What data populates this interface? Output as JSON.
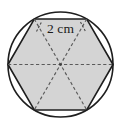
{
  "figure": {
    "measurement_label": "2 cm",
    "colors": {
      "background": "#ffffff",
      "hexagon_fill": "#d4d4d4",
      "outline": "#1e1e1e",
      "dashed_line": "#5a5a5a",
      "label_text": "#1a1a1a"
    },
    "circle": {
      "center_x": 60.5,
      "center_y": 64.5,
      "radius": 52.5,
      "stroke_width": 1.6
    },
    "hexagon": {
      "sides": 6,
      "orientation": "pointy-left-right",
      "circumradius": 52.5,
      "stroke_width": 1.6,
      "vertices": [
        {
          "x": 113.0,
          "y": 64.5
        },
        {
          "x": 86.75,
          "y": 19.03
        },
        {
          "x": 34.25,
          "y": 19.03
        },
        {
          "x": 8.0,
          "y": 64.5
        },
        {
          "x": 34.25,
          "y": 109.97
        },
        {
          "x": 86.75,
          "y": 109.97
        }
      ]
    },
    "diagonals": [
      {
        "name": "diagonal-horizontal",
        "from": 3,
        "to": 0
      },
      {
        "name": "diagonal-upper-left-to-lower-right",
        "from": 2,
        "to": 5
      },
      {
        "name": "diagonal-upper-right-to-lower-left",
        "from": 1,
        "to": 4
      }
    ],
    "tick_marks": {
      "left": {
        "x1": 36.5,
        "y1": 31.5,
        "x2": 41.5,
        "y2": 22.0
      },
      "right": {
        "x1": 80.5,
        "y1": 22.0,
        "x2": 85.5,
        "y2": 31.5
      }
    },
    "label_position": {
      "x": 60.5,
      "y": 32.5
    }
  }
}
